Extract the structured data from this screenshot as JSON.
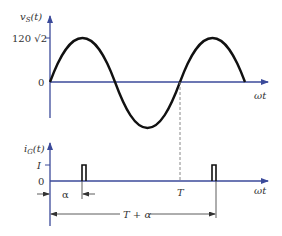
{
  "colors": {
    "axis": "#3b4a9a",
    "curve": "#111111",
    "pulse": "#111111",
    "dashed": "#888888",
    "text": "#333333",
    "dimension": "#333333"
  },
  "top_plot": {
    "ylabel": "vS(t)",
    "ylabel_main": "v",
    "ylabel_sub": "S",
    "ylabel_arg": "(t)",
    "peak_label": "120 √2",
    "zero_label": "0",
    "xlabel": "ωt",
    "curve": "sine"
  },
  "bottom_plot": {
    "ylabel_main": "i",
    "ylabel_sub": "G",
    "ylabel_arg": "(t)",
    "level_label": "I",
    "zero_label": "0",
    "xlabel": "ωt",
    "period_label": "T",
    "alpha_label": "α",
    "t_plus_alpha_label": "T + α",
    "pulses": 2
  }
}
